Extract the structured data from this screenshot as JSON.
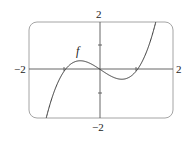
{
  "chart_data": {
    "type": "line",
    "title": "",
    "function_label": "f",
    "function": "x^3 - x",
    "xlabel": "",
    "ylabel": "",
    "xlim": [
      -2,
      2
    ],
    "ylim": [
      -2,
      2
    ],
    "tick_labels": {
      "x_min": "−2",
      "x_max": "2",
      "y_min": "−2",
      "y_max": "2"
    },
    "x_ticks": [
      -1,
      0,
      1
    ],
    "y_ticks": [
      -1,
      0,
      1
    ],
    "zeros": [
      -1,
      0,
      1
    ],
    "local_max": {
      "x": -0.577,
      "y": 0.385
    },
    "local_min": {
      "x": 0.577,
      "y": -0.385
    },
    "series": [
      {
        "name": "f",
        "x": [
          -1.5,
          -1.25,
          -1.0,
          -0.75,
          -0.5,
          -0.25,
          0,
          0.25,
          0.5,
          0.75,
          1.0,
          1.25,
          1.5
        ],
        "y": [
          -1.875,
          -0.703,
          0,
          0.328,
          0.375,
          0.234,
          0,
          -0.234,
          -0.375,
          -0.328,
          0,
          0.703,
          1.875
        ]
      }
    ],
    "grid": false,
    "legend": null
  }
}
